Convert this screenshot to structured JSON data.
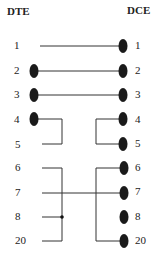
{
  "headers": {
    "left": "DTE",
    "right": "DCE"
  },
  "pins": {
    "left": [
      "1",
      "2",
      "3",
      "4",
      "5",
      "6",
      "7",
      "8",
      "20"
    ],
    "right": [
      "1",
      "2",
      "3",
      "4",
      "5",
      "6",
      "7",
      "8",
      "20"
    ]
  },
  "rows_y": [
    46,
    71,
    95,
    120,
    144,
    168,
    193,
    217,
    241
  ],
  "connectors": {
    "left_dots": [
      "2",
      "3",
      "4"
    ],
    "right_dots": [
      "1",
      "2",
      "3",
      "4",
      "5",
      "6",
      "7",
      "8",
      "20"
    ]
  },
  "wiring": [
    {
      "from": "DTE 1",
      "to": "DCE 1"
    },
    {
      "from": "DTE 2",
      "to": "DCE 2"
    },
    {
      "from": "DTE 3",
      "to": "DCE 3"
    },
    {
      "from": "DTE 4",
      "to": "DTE 5",
      "type": "loopback"
    },
    {
      "from": "DCE 4",
      "to": "DCE 5",
      "type": "loopback"
    },
    {
      "from": "DTE 6",
      "to": "DTE 8",
      "type": "bridge"
    },
    {
      "from": "DTE 8",
      "to": "DTE 20",
      "type": "bridge"
    },
    {
      "from": "DTE 7",
      "to": "DCE 7"
    },
    {
      "from": "DCE 6",
      "to": "DCE 20",
      "type": "bridge"
    }
  ],
  "colors": {
    "line": "#333333",
    "dot": "#1a1a1a"
  }
}
